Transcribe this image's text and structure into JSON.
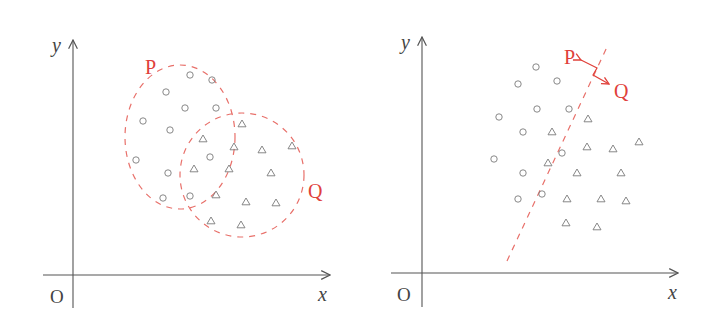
{
  "colors": {
    "accent": "#e0403a",
    "points": "#7a7a7a",
    "axis": "#555555"
  },
  "panels": [
    {
      "name": "left",
      "axes": {
        "origin_label": "O",
        "x_label": "x",
        "y_label": "y"
      },
      "regions": [
        {
          "label": "P",
          "shape": "ellipse",
          "cx": 180,
          "cy": 137,
          "rx": 55,
          "ry": 72,
          "label_x": 145,
          "label_y": 74
        },
        {
          "label": "Q",
          "shape": "ellipse",
          "cx": 242,
          "cy": 175,
          "rx": 62,
          "ry": 62,
          "label_x": 308,
          "label_y": 198
        }
      ],
      "circles": [
        [
          190,
          75
        ],
        [
          212,
          80
        ],
        [
          166,
          92
        ],
        [
          185,
          108
        ],
        [
          216,
          108
        ],
        [
          143,
          121
        ],
        [
          170,
          130
        ],
        [
          210,
          157
        ],
        [
          136,
          160
        ],
        [
          168,
          173
        ],
        [
          163,
          198
        ],
        [
          190,
          196
        ]
      ],
      "triangles": [
        [
          242,
          124
        ],
        [
          203,
          139
        ],
        [
          234,
          147
        ],
        [
          262,
          150
        ],
        [
          292,
          146
        ],
        [
          194,
          169
        ],
        [
          229,
          169
        ],
        [
          271,
          173
        ],
        [
          216,
          195
        ],
        [
          246,
          202
        ],
        [
          276,
          203
        ],
        [
          211,
          221
        ],
        [
          241,
          225
        ]
      ]
    },
    {
      "name": "right",
      "axes": {
        "origin_label": "O",
        "x_label": "x",
        "y_label": "y"
      },
      "boundary": {
        "x1": 507,
        "y1": 261,
        "x2": 607,
        "y2": 47
      },
      "labels": [
        {
          "text": "P",
          "x": 564,
          "y": 64
        },
        {
          "text": "Q",
          "x": 614,
          "y": 98
        }
      ],
      "circles": [
        [
          536,
          67
        ],
        [
          518,
          84
        ],
        [
          557,
          81
        ],
        [
          537,
          109
        ],
        [
          569,
          109
        ],
        [
          499,
          117
        ],
        [
          523,
          132
        ],
        [
          562,
          153
        ],
        [
          494,
          159
        ],
        [
          523,
          173
        ],
        [
          518,
          199
        ],
        [
          542,
          194
        ]
      ],
      "triangles": [
        [
          588,
          119
        ],
        [
          552,
          132
        ],
        [
          587,
          147
        ],
        [
          613,
          149
        ],
        [
          639,
          142
        ],
        [
          548,
          163
        ],
        [
          577,
          173
        ],
        [
          621,
          173
        ],
        [
          567,
          199
        ],
        [
          601,
          199
        ],
        [
          626,
          201
        ],
        [
          566,
          223
        ],
        [
          597,
          227
        ]
      ]
    }
  ]
}
